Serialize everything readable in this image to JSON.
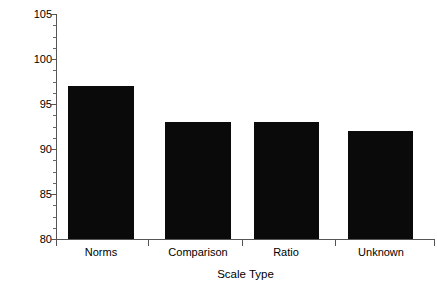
{
  "chart_data": {
    "type": "bar",
    "title": "",
    "subtitle": "",
    "xlabel": "Scale Type",
    "ylabel": "IQ (M=100, SD=15)",
    "categories": [
      "Norms",
      "Comparison",
      "Ratio",
      "Unknown"
    ],
    "values": [
      97,
      93,
      93,
      92
    ],
    "series": [
      {
        "name": "Mean IQ",
        "values": [
          97,
          93,
          93,
          92
        ]
      }
    ],
    "ylim": [
      80,
      105
    ],
    "ytick_labels": [
      "80",
      "85",
      "90",
      "95",
      "100",
      "105"
    ],
    "ytick_values": [
      80,
      85,
      90,
      95,
      100,
      105
    ],
    "yminor_step": 1.25,
    "grid": false,
    "legend": "none",
    "bar_color": "#0a0a0a",
    "axis_color": "#555555",
    "background_color": "#ffffff",
    "bar_geometry": [
      {
        "label": "Norms",
        "left_px": 12,
        "width_px": 66,
        "value": 97
      },
      {
        "label": "Comparison",
        "left_px": 109,
        "width_px": 66,
        "value": 93
      },
      {
        "label": "Ratio",
        "left_px": 198,
        "width_px": 65,
        "value": 93
      },
      {
        "label": "Unknown",
        "left_px": 292,
        "width_px": 65,
        "value": 92
      }
    ],
    "category_tick_px": [
      92,
      186,
      279
    ],
    "category_label_center_px": [
      45,
      142,
      230,
      325
    ]
  }
}
